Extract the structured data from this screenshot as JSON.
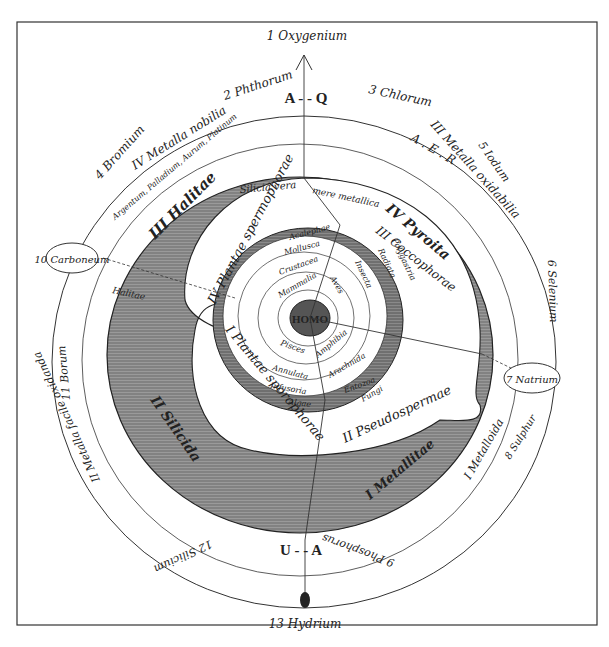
{
  "diagram": {
    "top_element": "1 Oxygenium",
    "bottom_element": "13 Hydrium",
    "center": "HOMO",
    "axis_top_letters": "A - - Q",
    "axis_bottom_letters": "U - - A",
    "outer_ring": {
      "elements": [
        "2 Phthorum",
        "3 Chlorum",
        "4 Bromium",
        "5 Iodum",
        "6 Selenium",
        "7 Natrium",
        "8 Sulphur",
        "9 Phosphorus",
        "10 Carboneum",
        "11 Borum",
        "12 Silicium"
      ],
      "metal_classes": [
        {
          "label": "IV Metalla nobilia",
          "sub": "Argentum, Palladium, Aurum, Platinum"
        },
        {
          "label": "III Metalla oxidabilia",
          "sub": "Baryum, Strontium, Calcium, Magnesium, ..."
        },
        {
          "label": "II Metalla facile oxidanda",
          "sub": "Cuprum, Nicol, Ferr., Mangan., Zinc., Stann., Cerium, ..."
        },
        {
          "label": "I Metalloida",
          "sub": "Lithologena et halogena"
        }
      ],
      "aer_letters": "A . E . R",
      "arabic_text_top": "Kalium, Natrium, Lithium, ..."
    },
    "shaded_ring": {
      "sections": [
        "III Halitae",
        "IV Pyroita",
        "II Silicida",
        "I Metallitae"
      ],
      "sub_labels": [
        "Halitae",
        "Halodea",
        "Silicia vera",
        "mere metallica",
        "Silicida vera",
        "Metalloidea",
        "Phytogena",
        "Zeolitae"
      ]
    },
    "plants_ring": {
      "sections": [
        "IV Plantae spermophorae",
        "I Plantae sporophorae",
        "II Pseudospermae",
        "III Coccophorae"
      ]
    },
    "animal_ring": {
      "labels": [
        "Acalephae",
        "Mollusca",
        "Crustacea",
        "Mammalia",
        "Aves",
        "Insecta",
        "Radiata",
        "Polygastria",
        "Pisces",
        "Amphibia",
        "Annulata",
        "Arachnida",
        "Infusoria",
        "Entozoa",
        "Algae",
        "Fungi"
      ]
    }
  }
}
